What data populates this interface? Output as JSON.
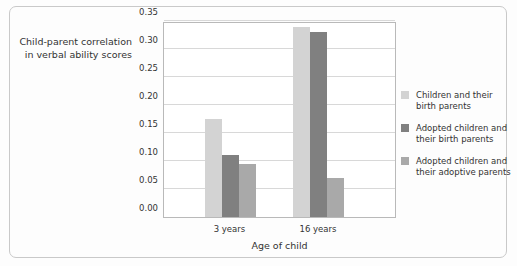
{
  "chart_data": {
    "type": "bar",
    "title": "",
    "xlabel": "Age of child",
    "ylabel_line1": "Child-parent correlation",
    "ylabel_line2": "in verbal ability scores",
    "categories": [
      "3 years",
      "16 years"
    ],
    "ylim": [
      0.0,
      0.35
    ],
    "yticks": [
      "0.00",
      "0.05",
      "0.10",
      "0.15",
      "0.20",
      "0.25",
      "0.30",
      "0.35"
    ],
    "ytick_values": [
      0.0,
      0.05,
      0.1,
      0.15,
      0.2,
      0.25,
      0.3,
      0.35
    ],
    "grid": "horizontal",
    "legend_position": "right",
    "series": [
      {
        "name_line1": "Children and their",
        "name_line2": "birth parents",
        "color": "#d3d3d3",
        "values": [
          0.175,
          0.34
        ]
      },
      {
        "name_line1": "Adopted children and",
        "name_line2": "their birth parents",
        "color": "#808080",
        "values": [
          0.11,
          0.33
        ]
      },
      {
        "name_line1": "Adopted children and",
        "name_line2": "their adoptive parents",
        "color": "#a9a9a9",
        "values": [
          0.095,
          0.07
        ]
      }
    ]
  }
}
